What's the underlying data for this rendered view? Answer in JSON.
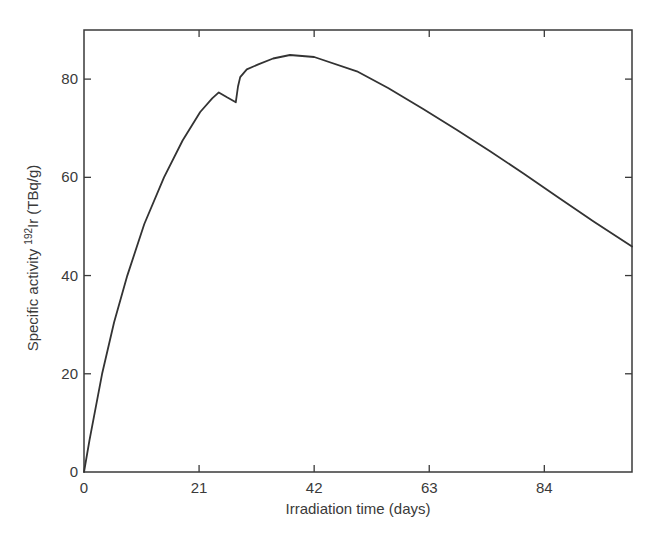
{
  "chart_data": {
    "type": "line",
    "title": "",
    "xlabel": "Irradiation time (days)",
    "ylabel_prefix": "Specific activity ",
    "ylabel_sup": "192",
    "ylabel_suffix": "Ir (TBq/g)",
    "ylabel": "Specific activity 192Ir (TBq/g)",
    "xlim": [
      0,
      100
    ],
    "ylim": [
      0,
      90
    ],
    "xticks": [
      0,
      21,
      42,
      63,
      84
    ],
    "yticks": [
      0,
      20,
      40,
      60,
      80
    ],
    "grid": false,
    "legend": null,
    "line_color": "#333333",
    "series": [
      {
        "name": "192Ir specific activity",
        "x": [
          0,
          1,
          3.3,
          5.5,
          7.9,
          11,
          14.6,
          18,
          21.2,
          23.4,
          24.6,
          26.1,
          27.7,
          28.1,
          28.5,
          29.7,
          31.8,
          34.5,
          37.6,
          42,
          49.8,
          55.5,
          61.9,
          68,
          74.1,
          80.2,
          86.3,
          93,
          100
        ],
        "y": [
          0,
          6.5,
          20,
          30.5,
          40,
          50.5,
          60,
          67.5,
          73.3,
          76.1,
          77.3,
          76.3,
          75.3,
          78.5,
          80.4,
          82,
          83,
          84.2,
          84.9,
          84.5,
          81.6,
          78.2,
          73.9,
          69.7,
          65.3,
          60.8,
          56.1,
          51,
          45.9
        ]
      }
    ]
  }
}
